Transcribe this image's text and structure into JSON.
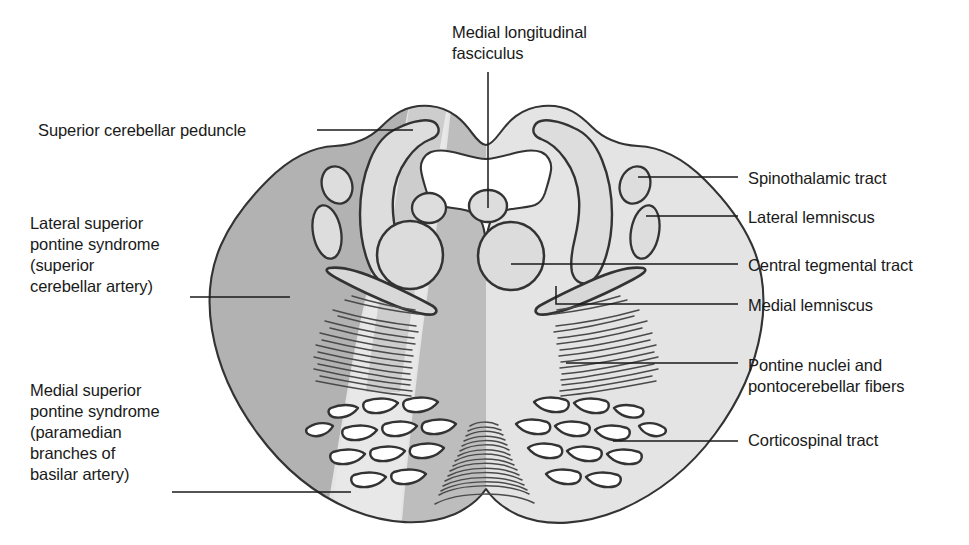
{
  "figure": {
    "type": "anatomical-diagram",
    "region": "Pons (superior pontine level)",
    "background_color": "#ffffff",
    "stroke_color": "#2b2b2b",
    "shades": {
      "lateral_syndrome_fill": "#b0b0b0",
      "medial_syndrome_fill": "#b8b8b8",
      "parenchyma_fill": "#e2e2e2",
      "ventricle_fill": "#ffffff",
      "nucleus_fill": "#dcdcdc"
    }
  },
  "labels": {
    "mlf": {
      "text": "Medial longitudinal\nfasciculus",
      "side": "top",
      "x": 452,
      "y": 22
    },
    "superior_cerebellar_peduncle": {
      "text": "Superior cerebellar peduncle",
      "side": "left",
      "x": 38,
      "y": 120
    },
    "lateral_superior_pontine_syndrome": {
      "text": "Lateral superior\npontine syndrome\n(superior\ncerebellar artery)",
      "side": "left",
      "x": 30,
      "y": 213
    },
    "medial_superior_pontine_syndrome": {
      "text": "Medial superior\npontine syndrome\n(paramedian\nbranches of\nbasilar artery)",
      "side": "left",
      "x": 30,
      "y": 380
    },
    "spinothalamic_tract": {
      "text": "Spinothalamic tract",
      "side": "right",
      "x": 748,
      "y": 168
    },
    "lateral_lemniscus": {
      "text": "Lateral lemniscus",
      "side": "right",
      "x": 748,
      "y": 207
    },
    "central_tegmental_tract": {
      "text": "Central tegmental tract",
      "side": "right",
      "x": 748,
      "y": 255
    },
    "medial_lemniscus": {
      "text": "Medial lemniscus",
      "side": "right",
      "x": 748,
      "y": 295
    },
    "pontine_nuclei": {
      "text": "Pontine nuclei and\npontocerebellar fibers",
      "side": "right",
      "x": 748,
      "y": 355
    },
    "corticospinal_tract": {
      "text": "Corticospinal tract",
      "side": "right",
      "x": 748,
      "y": 430
    }
  },
  "structures": [
    "Medial longitudinal fasciculus",
    "Superior cerebellar peduncle",
    "Spinothalamic tract",
    "Lateral lemniscus",
    "Central tegmental tract",
    "Medial lemniscus",
    "Pontine nuclei and pontocerebellar fibers",
    "Corticospinal tract",
    "Fourth ventricle"
  ],
  "vascular_syndromes": [
    "Lateral superior pontine syndrome (superior cerebellar artery)",
    "Medial superior pontine syndrome (paramedian branches of basilar artery)"
  ]
}
